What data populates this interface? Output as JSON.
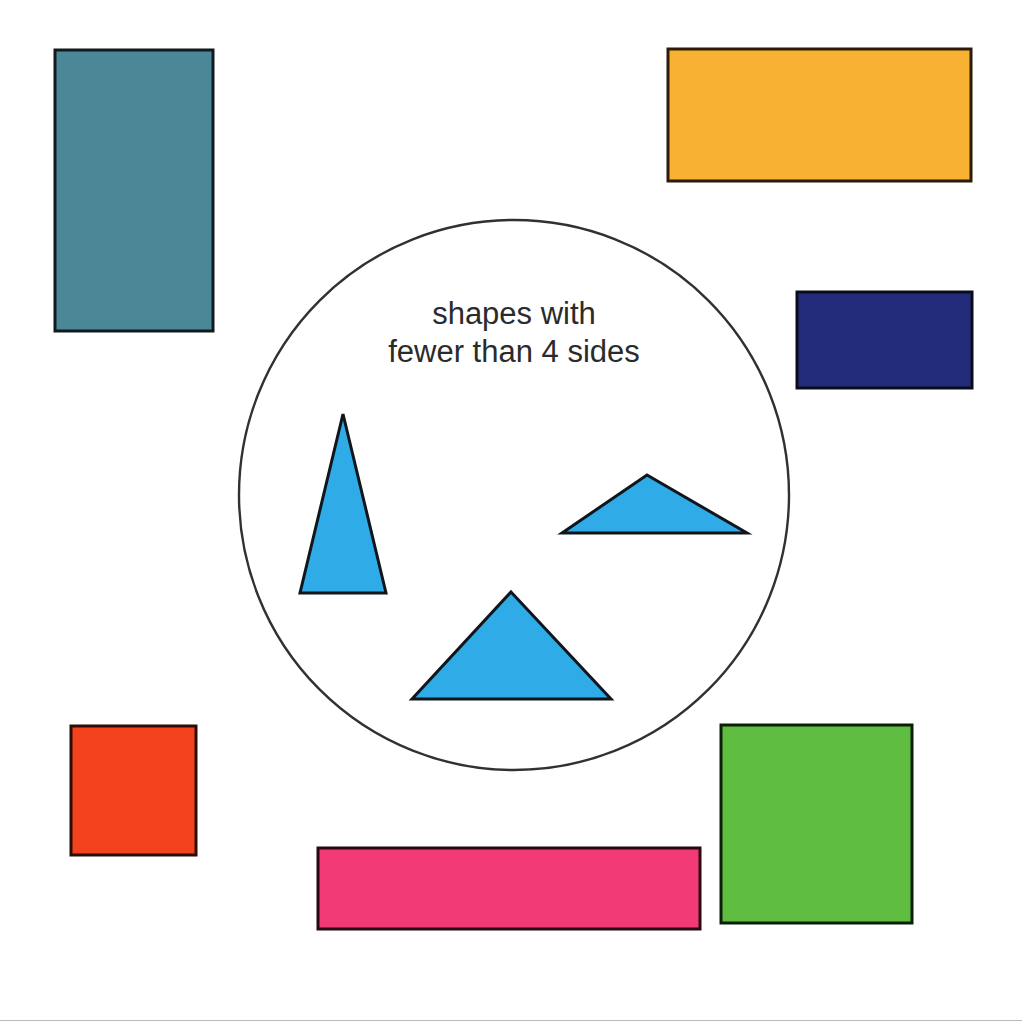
{
  "canvas": {
    "width": 1022,
    "height": 1026,
    "background": "#ffffff",
    "rule_color": "#b9b9bd"
  },
  "sorting_circle": {
    "label_line_1": "shapes with",
    "label_line_2": "fewer than 4 sides",
    "label_color": "#2b2b2b",
    "outline_color": "#33302f",
    "fill": "none",
    "center_x": 514,
    "center_y": 495,
    "radius": 275,
    "stroke_width": 2.4,
    "label_x": 514,
    "label_line_1_y": 324,
    "label_line_2_y": 362,
    "label_font_size": 31
  },
  "shapes_inside": [
    {
      "id": "tall-triangle",
      "name": "triangle",
      "sides": 3,
      "fill": "#2FACE8",
      "stroke": "#10161c",
      "stroke_width": 3,
      "points": "343,414 386,593 300,593"
    },
    {
      "id": "flat-triangle",
      "name": "triangle",
      "sides": 3,
      "fill": "#2FACE8",
      "stroke": "#10161c",
      "stroke_width": 3,
      "points": "647,475 747,533 562,533"
    },
    {
      "id": "wide-triangle",
      "name": "triangle",
      "sides": 3,
      "fill": "#2FACE8",
      "stroke": "#10161c",
      "stroke_width": 3,
      "points": "511,592 611,699 412,699"
    }
  ],
  "shapes_outside": [
    {
      "id": "teal-rectangle",
      "name": "rectangle",
      "sides": 4,
      "fill": "#4A8797",
      "stroke": "#101a1f",
      "stroke_width": 3,
      "x": 55,
      "y": 50,
      "width": 158,
      "height": 281
    },
    {
      "id": "orange-rectangle",
      "name": "rectangle",
      "sides": 4,
      "fill": "#F8B133",
      "stroke": "#2d1b09",
      "stroke_width": 3,
      "x": 668,
      "y": 49,
      "width": 303,
      "height": 132
    },
    {
      "id": "navy-rectangle",
      "name": "rectangle",
      "sides": 4,
      "fill": "#232C7A",
      "stroke": "#0a0c1c",
      "stroke_width": 3,
      "x": 797,
      "y": 292,
      "width": 175,
      "height": 96
    },
    {
      "id": "red-square",
      "name": "square",
      "sides": 4,
      "fill": "#F5421E",
      "stroke": "#2b0d06",
      "stroke_width": 3,
      "x": 71,
      "y": 726,
      "width": 125,
      "height": 129
    },
    {
      "id": "green-square",
      "name": "square",
      "sides": 4,
      "fill": "#5FBD42",
      "stroke": "#0d1f09",
      "stroke_width": 3,
      "x": 721,
      "y": 725,
      "width": 191,
      "height": 198
    },
    {
      "id": "pink-rectangle",
      "name": "rectangle",
      "sides": 4,
      "fill": "#F23A77",
      "stroke": "#2a0713",
      "stroke_width": 3,
      "x": 318,
      "y": 848,
      "width": 382,
      "height": 81
    }
  ]
}
